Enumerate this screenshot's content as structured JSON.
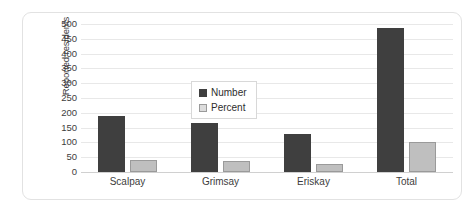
{
  "chart_data": {
    "type": "bar",
    "title": "",
    "xlabel": "",
    "ylabel": "Reported residents",
    "categories": [
      "Scalpay",
      "Grimsay",
      "Eriskay",
      "Total"
    ],
    "series": [
      {
        "name": "Number",
        "color": "#3f3f3f",
        "values": [
          190,
          165,
          127,
          485
        ]
      },
      {
        "name": "Percent",
        "color": "#bfbfbf",
        "values": [
          40,
          36,
          27,
          102
        ]
      }
    ],
    "ylim": [
      0,
      500
    ],
    "ytick_step": 50,
    "yticks": [
      "0",
      "50",
      "100",
      "150",
      "200",
      "250",
      "300",
      "350",
      "400",
      "450",
      "500"
    ],
    "grid": "horizontal",
    "legend_position": "inside-upper-left"
  },
  "legend": {
    "entries": [
      {
        "label": "Number",
        "swatch": "dark-square-swatch"
      },
      {
        "label": "Percent",
        "swatch": "light-square-swatch"
      }
    ]
  },
  "colors": {
    "series_number": "#3f3f3f",
    "series_percent": "#bfbfbf",
    "percent_border": "#9a9a9a",
    "gridline": "#e8e8e8",
    "axis_line": "#d0d0d0",
    "card_border": "#e2e2e2",
    "text": "#3d3d3d",
    "background": "#ffffff"
  }
}
